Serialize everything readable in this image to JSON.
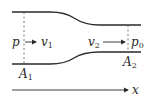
{
  "diagram": {
    "type": "converging-nozzle",
    "labels": {
      "p": "p",
      "v1": "v",
      "v1_sub": "1",
      "v2": "v",
      "v2_sub": "2",
      "p0": "p",
      "p0_sub": "0",
      "A1": "A",
      "A1_sub": "1",
      "A2": "A",
      "A2_sub": "2",
      "x_axis": "x"
    },
    "colors": {
      "stroke": "#2a2a2a",
      "dashed": "#555555",
      "background": "#ffffff"
    }
  }
}
